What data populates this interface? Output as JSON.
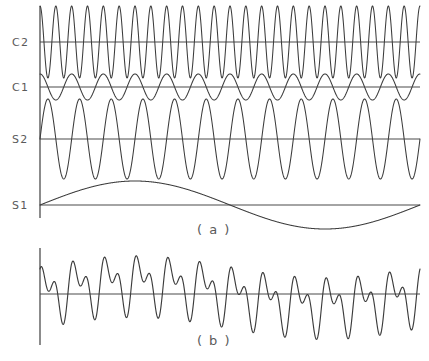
{
  "figure": {
    "width": 429,
    "height": 361,
    "background_color": "#ffffff",
    "line_color": "#3c3c3c",
    "axis_color": "#5b5b5b",
    "text_color": "#5a5a5a"
  },
  "panels": [
    {
      "caption": "( a )",
      "caption_x": 214,
      "caption_y": 234,
      "axis_x": 40,
      "axis_top": 6,
      "axis_bottom": 218,
      "plot_left": 40,
      "plot_right": 420
    },
    {
      "caption": "( b )",
      "caption_x": 214,
      "caption_y": 345,
      "axis_x": 40,
      "axis_top": 248,
      "axis_bottom": 345,
      "plot_left": 40,
      "plot_right": 420
    }
  ],
  "chart_data": {
    "type": "line",
    "title": "",
    "subtitle": "",
    "xlabel": "",
    "ylabel": "",
    "grid": false,
    "legend_position": "left-axis-labels",
    "x_domain": [
      0,
      1
    ],
    "series": [
      {
        "name": "C2",
        "label": "C2",
        "waveform": "cos",
        "cycles": 24,
        "amplitude": 1.0,
        "phase_deg": 0,
        "baseline_y": 42,
        "pixel_amplitude": 36,
        "label_x": 12,
        "label_y": 46
      },
      {
        "name": "C1",
        "label": "C1",
        "waveform": "cos",
        "cycles": 12,
        "amplitude": 1.0,
        "phase_deg": 0,
        "baseline_y": 87,
        "pixel_amplitude": 13,
        "label_x": 12,
        "label_y": 91
      },
      {
        "name": "S2",
        "label": "S2",
        "waveform": "sin",
        "cycles": 12,
        "amplitude": 1.0,
        "phase_deg": 0,
        "baseline_y": 139,
        "pixel_amplitude": 40,
        "label_x": 12,
        "label_y": 143
      },
      {
        "name": "S1",
        "label": "S1",
        "waveform": "sin",
        "cycles": 1,
        "amplitude": 1.0,
        "phase_deg": 0,
        "baseline_y": 205,
        "pixel_amplitude": 24,
        "label_x": 12,
        "label_y": 209
      }
    ],
    "sum_series": {
      "name": "sum",
      "label": "",
      "baseline_y": 294,
      "components": [
        "C2",
        "C1",
        "S2",
        "S1"
      ],
      "component_pixel_amplitudes": [
        16,
        9,
        18,
        11
      ],
      "pixel_amplitude_total": 54
    }
  }
}
